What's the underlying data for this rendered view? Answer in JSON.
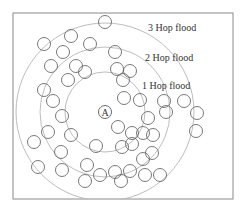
{
  "diagram": {
    "colors": {
      "border": "#8a8a8a",
      "ring": "#b5b5b5",
      "node": "#6a6a6a",
      "text": "#333333",
      "background": "#ffffff"
    },
    "frame": {
      "x": 13,
      "y": 13,
      "width": 220,
      "height": 186
    },
    "source": {
      "label": "A",
      "cx": 105,
      "cy": 112,
      "r": 6.5
    },
    "rings": [
      {
        "name": "1 Hop flood",
        "r": 40,
        "label_x": 142,
        "label_y": 89
      },
      {
        "name": "2 Hop flood",
        "r": 65,
        "label_x": 145,
        "label_y": 61
      },
      {
        "name": "3 Hop flood",
        "r": 89,
        "label_x": 148,
        "label_y": 31
      }
    ],
    "node_radius": 6.5,
    "nodes": [
      [
        105,
        22
      ],
      [
        71,
        36
      ],
      [
        44,
        44
      ],
      [
        63,
        52
      ],
      [
        90,
        44
      ],
      [
        115,
        52
      ],
      [
        51,
        66
      ],
      [
        76,
        66
      ],
      [
        85,
        72
      ],
      [
        117,
        69
      ],
      [
        130,
        71
      ],
      [
        68,
        80
      ],
      [
        44,
        90
      ],
      [
        53,
        101
      ],
      [
        62,
        116
      ],
      [
        48,
        132
      ],
      [
        71,
        135
      ],
      [
        34,
        142
      ],
      [
        61,
        152
      ],
      [
        38,
        167
      ],
      [
        62,
        170
      ],
      [
        87,
        165
      ],
      [
        96,
        146
      ],
      [
        118,
        127
      ],
      [
        124,
        98
      ],
      [
        123,
        80
      ],
      [
        140,
        100
      ],
      [
        122,
        147
      ],
      [
        132,
        133
      ],
      [
        132,
        144
      ],
      [
        143,
        159
      ],
      [
        130,
        171
      ],
      [
        115,
        172
      ],
      [
        100,
        175
      ],
      [
        85,
        181
      ],
      [
        143,
        133
      ],
      [
        153,
        135
      ],
      [
        148,
        118
      ],
      [
        152,
        153
      ],
      [
        145,
        175
      ],
      [
        166,
        112
      ],
      [
        164,
        101
      ],
      [
        196,
        131
      ],
      [
        197,
        113
      ],
      [
        184,
        101
      ],
      [
        121,
        181
      ],
      [
        160,
        175
      ]
    ]
  }
}
